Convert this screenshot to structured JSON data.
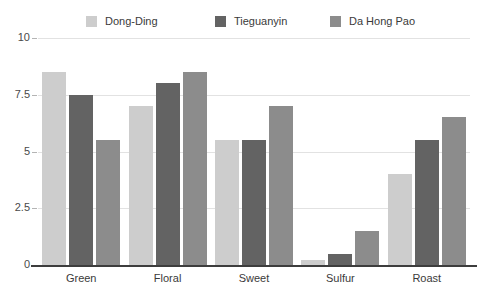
{
  "chart_data": {
    "type": "bar",
    "title": "",
    "subtitle": "",
    "xlabel": "",
    "ylabel": "",
    "categories": [
      "Green",
      "Floral",
      "Sweet",
      "Sulfur",
      "Roast"
    ],
    "series": [
      {
        "name": "Dong-Ding",
        "color": "#cdcdcd",
        "values": [
          8.5,
          7.0,
          5.5,
          0.2,
          4.0
        ]
      },
      {
        "name": "Tieguanyin",
        "color": "#636363",
        "values": [
          7.5,
          8.0,
          5.5,
          0.5,
          5.5
        ]
      },
      {
        "name": "Da Hong Pao",
        "color": "#8c8c8c",
        "values": [
          5.5,
          8.5,
          7.0,
          1.5,
          6.5
        ]
      }
    ],
    "ylim": [
      0,
      10
    ],
    "yticks": [
      0,
      2.5,
      5,
      7.5,
      10
    ],
    "ytick_labels": [
      "0",
      "2.5",
      "5",
      "7.5",
      "10"
    ],
    "grid": true,
    "grid_color": "#e2e2e2",
    "legend_position": "top",
    "axis_line_color": "#3d3d3d",
    "background_color": "#ffffff",
    "text_color": "#3a3a3a"
  }
}
